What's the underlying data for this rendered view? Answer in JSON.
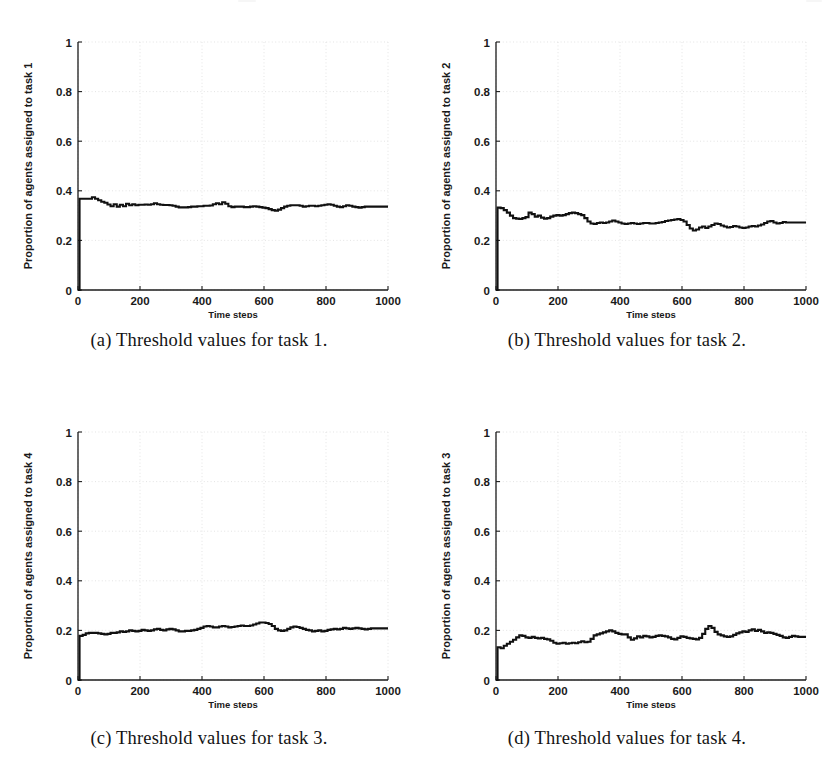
{
  "figure": {
    "panel_count": 4,
    "background_color": "#ffffff",
    "trace_color": "#111111",
    "grid_color": "#d9d9d9",
    "axis_color": "#1c1c1c"
  },
  "panels": [
    {
      "key": "a",
      "caption": "(a) Threshold values for task 1.",
      "ylabel": "Proportion of agents assigned to task 1",
      "xlabel": "Time steps"
    },
    {
      "key": "b",
      "caption": "(b) Threshold values for task 2.",
      "ylabel": "Proportion of agents assigned to task 2",
      "xlabel": "Time steps"
    },
    {
      "key": "c",
      "caption": "(c) Threshold values for task 3.",
      "ylabel": "Proportion of agents assigned to task 4",
      "xlabel": "Time steps"
    },
    {
      "key": "d",
      "caption": "(d) Threshold values for task 4.",
      "ylabel": "Proportion of agents assigned to task 3",
      "xlabel": "Time steps"
    }
  ],
  "chart_data": [
    {
      "type": "line",
      "panel": "a",
      "title": "(a) Threshold values for task 1.",
      "xlabel": "Time steps",
      "ylabel": "Proportion of agents assigned to task 1",
      "xlim": [
        0,
        1000
      ],
      "ylim": [
        0,
        1
      ],
      "xticks": [
        0,
        200,
        400,
        600,
        800,
        1000
      ],
      "yticks": [
        0,
        0.2,
        0.4,
        0.6,
        0.8,
        1
      ],
      "xticklabels": [
        "0",
        "200",
        "400",
        "600",
        "800",
        "1000"
      ],
      "yticklabels": [
        "0",
        "0.2",
        "0.4",
        "0.6",
        "0.8",
        "1"
      ],
      "grid": true,
      "legend": null,
      "x": [
        0,
        5,
        15,
        25,
        35,
        45,
        55,
        65,
        75,
        85,
        95,
        105,
        115,
        125,
        135,
        145,
        155,
        165,
        175,
        185,
        195,
        205,
        215,
        225,
        235,
        245,
        255,
        265,
        275,
        285,
        295,
        305,
        315,
        325,
        335,
        345,
        355,
        365,
        375,
        385,
        395,
        405,
        415,
        425,
        435,
        445,
        455,
        465,
        475,
        485,
        495,
        505,
        515,
        525,
        535,
        545,
        555,
        565,
        575,
        585,
        595,
        605,
        615,
        625,
        635,
        645,
        655,
        665,
        675,
        685,
        695,
        705,
        715,
        725,
        735,
        745,
        755,
        765,
        775,
        785,
        795,
        805,
        815,
        825,
        835,
        845,
        855,
        865,
        875,
        885,
        895,
        905,
        915,
        925,
        935,
        945,
        955,
        965,
        975,
        985,
        1000
      ],
      "y": [
        0.0,
        0.368,
        0.368,
        0.368,
        0.368,
        0.374,
        0.368,
        0.362,
        0.356,
        0.352,
        0.345,
        0.338,
        0.346,
        0.336,
        0.344,
        0.338,
        0.348,
        0.342,
        0.346,
        0.342,
        0.344,
        0.344,
        0.345,
        0.344,
        0.346,
        0.35,
        0.346,
        0.344,
        0.343,
        0.343,
        0.342,
        0.34,
        0.336,
        0.333,
        0.333,
        0.333,
        0.334,
        0.336,
        0.336,
        0.338,
        0.338,
        0.34,
        0.34,
        0.341,
        0.346,
        0.35,
        0.346,
        0.354,
        0.348,
        0.338,
        0.334,
        0.336,
        0.336,
        0.336,
        0.334,
        0.334,
        0.336,
        0.338,
        0.336,
        0.334,
        0.332,
        0.33,
        0.326,
        0.322,
        0.32,
        0.324,
        0.33,
        0.336,
        0.34,
        0.342,
        0.342,
        0.342,
        0.34,
        0.336,
        0.338,
        0.34,
        0.34,
        0.338,
        0.34,
        0.342,
        0.344,
        0.346,
        0.344,
        0.34,
        0.336,
        0.334,
        0.338,
        0.342,
        0.34,
        0.336,
        0.334,
        0.332,
        0.334,
        0.336,
        0.336,
        0.336,
        0.336,
        0.336,
        0.336,
        0.336,
        0.336
      ]
    },
    {
      "type": "line",
      "panel": "b",
      "title": "(b) Threshold values for task 2.",
      "xlabel": "Time steps",
      "ylabel": "Proportion of agents assigned to task 2",
      "xlim": [
        0,
        1000
      ],
      "ylim": [
        0,
        1
      ],
      "xticks": [
        0,
        200,
        400,
        600,
        800,
        1000
      ],
      "yticks": [
        0,
        0.2,
        0.4,
        0.6,
        0.8,
        1
      ],
      "xticklabels": [
        "0",
        "200",
        "400",
        "600",
        "800",
        "1000"
      ],
      "yticklabels": [
        "0",
        "0.2",
        "0.4",
        "0.6",
        "0.8",
        "1"
      ],
      "grid": true,
      "legend": null,
      "x": [
        0,
        5,
        15,
        25,
        35,
        45,
        55,
        65,
        75,
        85,
        95,
        105,
        115,
        125,
        135,
        145,
        155,
        165,
        175,
        185,
        195,
        205,
        215,
        225,
        235,
        245,
        255,
        265,
        275,
        285,
        295,
        305,
        315,
        325,
        335,
        345,
        355,
        365,
        375,
        385,
        395,
        405,
        415,
        425,
        435,
        445,
        455,
        465,
        475,
        485,
        495,
        505,
        515,
        525,
        535,
        545,
        555,
        565,
        575,
        585,
        595,
        605,
        615,
        625,
        635,
        645,
        655,
        665,
        675,
        685,
        695,
        705,
        715,
        725,
        735,
        745,
        755,
        765,
        775,
        785,
        795,
        805,
        815,
        825,
        835,
        845,
        855,
        865,
        875,
        885,
        895,
        905,
        915,
        925,
        935,
        945,
        955,
        965,
        975,
        985,
        1000
      ],
      "y": [
        0.0,
        0.332,
        0.33,
        0.322,
        0.312,
        0.3,
        0.29,
        0.288,
        0.286,
        0.29,
        0.294,
        0.312,
        0.306,
        0.296,
        0.3,
        0.292,
        0.288,
        0.29,
        0.296,
        0.3,
        0.302,
        0.3,
        0.302,
        0.306,
        0.31,
        0.312,
        0.31,
        0.306,
        0.302,
        0.29,
        0.276,
        0.268,
        0.266,
        0.27,
        0.272,
        0.27,
        0.272,
        0.276,
        0.28,
        0.276,
        0.272,
        0.268,
        0.266,
        0.268,
        0.27,
        0.268,
        0.266,
        0.268,
        0.27,
        0.27,
        0.268,
        0.268,
        0.27,
        0.272,
        0.274,
        0.278,
        0.28,
        0.282,
        0.284,
        0.286,
        0.282,
        0.276,
        0.262,
        0.248,
        0.24,
        0.244,
        0.252,
        0.256,
        0.25,
        0.256,
        0.262,
        0.268,
        0.266,
        0.26,
        0.256,
        0.252,
        0.254,
        0.258,
        0.256,
        0.252,
        0.25,
        0.252,
        0.256,
        0.258,
        0.256,
        0.26,
        0.264,
        0.27,
        0.276,
        0.278,
        0.272,
        0.268,
        0.27,
        0.274,
        0.272,
        0.272,
        0.272,
        0.272,
        0.272,
        0.272,
        0.272
      ]
    },
    {
      "type": "line",
      "panel": "c",
      "title": "(c) Threshold values for task 3.",
      "xlabel": "Time steps",
      "ylabel": "Proportion of agents assigned to task 4",
      "xlim": [
        0,
        1000
      ],
      "ylim": [
        0,
        1
      ],
      "xticks": [
        0,
        200,
        400,
        600,
        800,
        1000
      ],
      "yticks": [
        0,
        0.2,
        0.4,
        0.6,
        0.8,
        1
      ],
      "xticklabels": [
        "0",
        "200",
        "400",
        "600",
        "800",
        "1000"
      ],
      "yticklabels": [
        "0",
        "0.2",
        "0.4",
        "0.6",
        "0.8",
        "1"
      ],
      "grid": true,
      "legend": null,
      "x": [
        0,
        5,
        15,
        25,
        35,
        45,
        55,
        65,
        75,
        85,
        95,
        105,
        115,
        125,
        135,
        145,
        155,
        165,
        175,
        185,
        195,
        205,
        215,
        225,
        235,
        245,
        255,
        265,
        275,
        285,
        295,
        305,
        315,
        325,
        335,
        345,
        355,
        365,
        375,
        385,
        395,
        405,
        415,
        425,
        435,
        445,
        455,
        465,
        475,
        485,
        495,
        505,
        515,
        525,
        535,
        545,
        555,
        565,
        575,
        585,
        595,
        605,
        615,
        625,
        635,
        645,
        655,
        665,
        675,
        685,
        695,
        705,
        715,
        725,
        735,
        745,
        755,
        765,
        775,
        785,
        795,
        805,
        815,
        825,
        835,
        845,
        855,
        865,
        875,
        885,
        895,
        905,
        915,
        925,
        935,
        945,
        955,
        965,
        975,
        985,
        1000
      ],
      "y": [
        0.0,
        0.178,
        0.182,
        0.188,
        0.19,
        0.19,
        0.19,
        0.188,
        0.186,
        0.184,
        0.186,
        0.19,
        0.19,
        0.192,
        0.196,
        0.194,
        0.196,
        0.2,
        0.198,
        0.196,
        0.198,
        0.202,
        0.2,
        0.198,
        0.2,
        0.204,
        0.206,
        0.202,
        0.2,
        0.204,
        0.206,
        0.204,
        0.2,
        0.196,
        0.196,
        0.198,
        0.198,
        0.2,
        0.202,
        0.206,
        0.21,
        0.216,
        0.218,
        0.216,
        0.212,
        0.212,
        0.216,
        0.218,
        0.216,
        0.212,
        0.214,
        0.216,
        0.218,
        0.22,
        0.218,
        0.218,
        0.22,
        0.224,
        0.228,
        0.232,
        0.232,
        0.23,
        0.226,
        0.218,
        0.206,
        0.2,
        0.198,
        0.2,
        0.206,
        0.212,
        0.216,
        0.214,
        0.21,
        0.206,
        0.202,
        0.2,
        0.196,
        0.198,
        0.2,
        0.196,
        0.198,
        0.202,
        0.204,
        0.206,
        0.204,
        0.206,
        0.21,
        0.208,
        0.206,
        0.208,
        0.21,
        0.208,
        0.206,
        0.204,
        0.206,
        0.208,
        0.208,
        0.208,
        0.208,
        0.208,
        0.208
      ]
    },
    {
      "type": "line",
      "panel": "d",
      "title": "(d) Threshold values for task 4.",
      "xlabel": "Time steps",
      "ylabel": "Proportion of agents assigned to task 3",
      "xlim": [
        0,
        1000
      ],
      "ylim": [
        0,
        1
      ],
      "xticks": [
        0,
        200,
        400,
        600,
        800,
        1000
      ],
      "yticks": [
        0,
        0.2,
        0.4,
        0.6,
        0.8,
        1
      ],
      "xticklabels": [
        "0",
        "200",
        "400",
        "600",
        "800",
        "1000"
      ],
      "yticklabels": [
        "0",
        "0.2",
        "0.4",
        "0.6",
        "0.8",
        "1"
      ],
      "grid": true,
      "legend": null,
      "x": [
        0,
        5,
        15,
        25,
        35,
        45,
        55,
        65,
        75,
        85,
        95,
        105,
        115,
        125,
        135,
        145,
        155,
        165,
        175,
        185,
        195,
        205,
        215,
        225,
        235,
        245,
        255,
        265,
        275,
        285,
        295,
        305,
        315,
        325,
        335,
        345,
        355,
        365,
        375,
        385,
        395,
        405,
        415,
        425,
        435,
        445,
        455,
        465,
        475,
        485,
        495,
        505,
        515,
        525,
        535,
        545,
        555,
        565,
        575,
        585,
        595,
        605,
        615,
        625,
        635,
        645,
        655,
        665,
        675,
        685,
        695,
        705,
        715,
        725,
        735,
        745,
        755,
        765,
        775,
        785,
        795,
        805,
        815,
        825,
        835,
        845,
        855,
        865,
        875,
        885,
        895,
        905,
        915,
        925,
        935,
        945,
        955,
        965,
        975,
        985,
        1000
      ],
      "y": [
        0.0,
        0.132,
        0.128,
        0.138,
        0.146,
        0.154,
        0.162,
        0.172,
        0.18,
        0.178,
        0.172,
        0.17,
        0.174,
        0.17,
        0.168,
        0.17,
        0.166,
        0.164,
        0.158,
        0.15,
        0.146,
        0.148,
        0.15,
        0.146,
        0.148,
        0.15,
        0.148,
        0.152,
        0.156,
        0.152,
        0.154,
        0.166,
        0.18,
        0.184,
        0.188,
        0.192,
        0.196,
        0.2,
        0.196,
        0.19,
        0.186,
        0.184,
        0.184,
        0.172,
        0.162,
        0.168,
        0.176,
        0.172,
        0.178,
        0.176,
        0.172,
        0.174,
        0.178,
        0.18,
        0.178,
        0.176,
        0.172,
        0.166,
        0.164,
        0.17,
        0.176,
        0.174,
        0.17,
        0.168,
        0.166,
        0.164,
        0.17,
        0.186,
        0.206,
        0.218,
        0.21,
        0.194,
        0.184,
        0.18,
        0.176,
        0.174,
        0.176,
        0.182,
        0.188,
        0.192,
        0.196,
        0.194,
        0.2,
        0.204,
        0.198,
        0.202,
        0.196,
        0.19,
        0.192,
        0.19,
        0.186,
        0.182,
        0.178,
        0.172,
        0.17,
        0.174,
        0.178,
        0.176,
        0.174,
        0.174,
        0.174
      ]
    }
  ]
}
